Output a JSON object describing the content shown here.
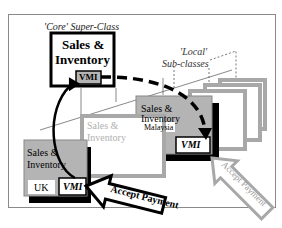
{
  "diagram": {
    "core": {
      "caption": "'Core' Super-Class",
      "title_line1": "Sales &",
      "title_line2": "Inventory",
      "module": "VMI"
    },
    "local": {
      "caption_line1": "'Local'",
      "caption_line2": "Sub-classes"
    },
    "subclasses": [
      {
        "title_line1": "Sales &",
        "title_line2": "Inventory",
        "country": "UK",
        "module": "VMI",
        "style": "active"
      },
      {
        "title_line1": "Sales &",
        "title_line2": "Inventory",
        "country": "",
        "module": "",
        "style": "faded"
      },
      {
        "title_line1": "Sales &",
        "title_line2": "Inventory",
        "country": "Malaysia",
        "module": "VMI",
        "style": "active"
      }
    ],
    "arrows": [
      {
        "label": "Accept Payment",
        "style": "bold",
        "target": "UK VMI"
      },
      {
        "label": "Accept Payment",
        "style": "faded",
        "target": "Malaysia VMI"
      }
    ],
    "colors": {
      "box_fill": "#b4b4b4",
      "faded_border": "#a8a8a8",
      "black": "#000000",
      "frame": "#8a8a8a"
    }
  }
}
